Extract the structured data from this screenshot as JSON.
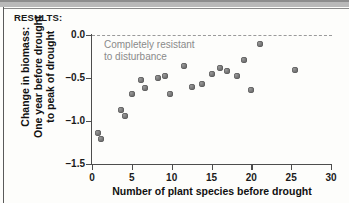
{
  "section": {
    "results_label": "RESULTS:"
  },
  "chart_data": {
    "type": "scatter",
    "title": "",
    "xlabel": "Number of plant species before drought",
    "ylabel": "Change in biomass:\nOne year before drought\nto peak of drought",
    "ylabel_lines": [
      "Change in biomass:",
      "One year before drought",
      "to peak of drought"
    ],
    "xlim": [
      0,
      30
    ],
    "ylim": [
      -1.5,
      0.0
    ],
    "xticks": [
      0,
      5,
      10,
      15,
      20,
      25,
      30
    ],
    "xtick_labels": [
      "0",
      "5",
      "10",
      "15",
      "20",
      "25",
      "30"
    ],
    "yticks": [
      0.0,
      -0.5,
      -1.0,
      -1.5
    ],
    "ytick_labels": [
      "0.0",
      "-0.5",
      "-1.0",
      "-1.5"
    ],
    "grid": false,
    "legend": null,
    "reference_lines": [
      {
        "name": "zero-line",
        "y": 0.0,
        "style": "dashed",
        "color": "#9a9a9a"
      }
    ],
    "annotations": [
      {
        "text": "Completely resistant\nto disturbance",
        "lines": [
          "Completely resistant",
          "to disturbance"
        ],
        "x": 1.5,
        "y": -0.05,
        "color": "#8a8a8a"
      }
    ],
    "marker_color": "#6e6e6e",
    "points": [
      {
        "x": 0.7,
        "y": -1.14
      },
      {
        "x": 1.1,
        "y": -1.21
      },
      {
        "x": 3.6,
        "y": -0.87
      },
      {
        "x": 4.1,
        "y": -0.94
      },
      {
        "x": 5.0,
        "y": -0.69
      },
      {
        "x": 6.1,
        "y": -0.52
      },
      {
        "x": 6.7,
        "y": -0.62
      },
      {
        "x": 8.3,
        "y": -0.5
      },
      {
        "x": 9.2,
        "y": -0.48
      },
      {
        "x": 9.8,
        "y": -0.69
      },
      {
        "x": 11.5,
        "y": -0.36
      },
      {
        "x": 12.6,
        "y": -0.6
      },
      {
        "x": 13.8,
        "y": -0.57
      },
      {
        "x": 15.1,
        "y": -0.45
      },
      {
        "x": 16.1,
        "y": -0.38
      },
      {
        "x": 17.0,
        "y": -0.42
      },
      {
        "x": 18.2,
        "y": -0.48
      },
      {
        "x": 19.1,
        "y": -0.29
      },
      {
        "x": 20.0,
        "y": -0.64
      },
      {
        "x": 21.1,
        "y": -0.11
      },
      {
        "x": 25.5,
        "y": -0.41
      }
    ]
  }
}
